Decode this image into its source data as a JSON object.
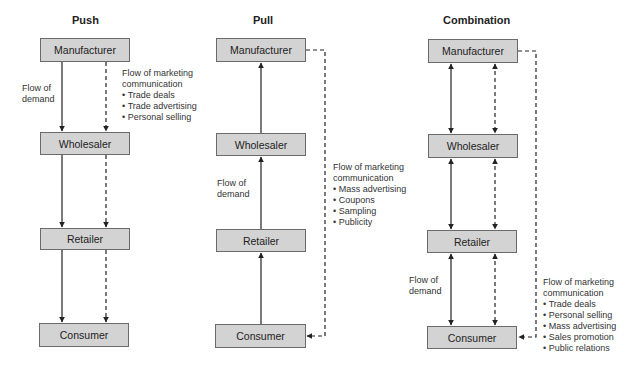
{
  "diagram": {
    "box_fill": "#d3d3d3",
    "box_border": "#6a6a6a",
    "line_color": "#222222",
    "panels": [
      {
        "title": "Push",
        "boxes": [
          "Manufacturer",
          "Wholesaler",
          "Retailer",
          "Consumer"
        ],
        "demand_label": "Flow of demand",
        "demand_direction": "down",
        "communication": {
          "heading": "Flow of marketing communication",
          "items": [
            "Trade deals",
            "Trade advertising",
            "Personal selling"
          ]
        }
      },
      {
        "title": "Pull",
        "boxes": [
          "Manufacturer",
          "Wholesaler",
          "Retailer",
          "Consumer"
        ],
        "demand_label": "Flow of demand",
        "demand_direction": "up",
        "communication": {
          "heading": "Flow of marketing communication",
          "items": [
            "Mass advertising",
            "Coupons",
            "Sampling",
            "Publicity"
          ]
        }
      },
      {
        "title": "Combination",
        "boxes": [
          "Manufacturer",
          "Wholesaler",
          "Retailer",
          "Consumer"
        ],
        "demand_label": "Flow of demand",
        "demand_direction": "both",
        "communication": {
          "heading": "Flow of marketing communication",
          "items": [
            "Trade deals",
            "Personal selling",
            "Mass advertising",
            "Sales promotion",
            "Public relations"
          ]
        }
      }
    ]
  }
}
